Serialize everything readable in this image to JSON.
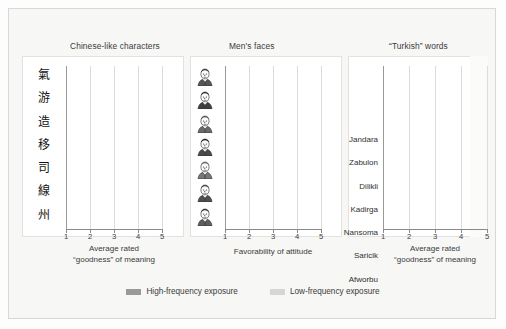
{
  "figure": {
    "background_color": "#f7f7f6",
    "high_color": "#9a9a9a",
    "low_color": "#d6d6d6"
  },
  "legend": {
    "items": [
      {
        "label": "High-frequency exposure",
        "color": "#9a9a9a",
        "key": "high"
      },
      {
        "label": "Low-frequency exposure",
        "color": "#d6d6d6",
        "key": "low"
      }
    ]
  },
  "chart_data": [
    {
      "type": "bar",
      "title": "Chinese-like characters",
      "orientation": "horizontal",
      "xlabel_line1": "Average rated",
      "xlabel_line2": "“goodness” of meaning",
      "ylabel": "",
      "xlim": [
        1,
        5
      ],
      "xticks": [
        1,
        2,
        3,
        4,
        5
      ],
      "grid": true,
      "legend_position": "bottom",
      "categories": [
        "char-1",
        "char-2",
        "char-3",
        "char-4",
        "char-5",
        "char-6",
        "char-7"
      ],
      "category_glyphs": [
        "氣",
        "游",
        "造",
        "移",
        "司",
        "線",
        "州"
      ],
      "series": [
        {
          "name": "High-frequency exposure",
          "key": "high",
          "values": [
            4.0,
            3.5,
            3.3,
            3.4,
            3.3,
            2.9,
            2.9
          ]
        },
        {
          "name": "Low-frequency exposure",
          "key": "low",
          "values": [
            3.4,
            3.0,
            1.4,
            2.9,
            2.5,
            2.4,
            2.6
          ]
        }
      ]
    },
    {
      "type": "bar",
      "title": "Men's faces",
      "orientation": "horizontal",
      "xlabel_line1": "Favorability of attitude",
      "xlabel_line2": "",
      "ylabel": "",
      "xlim": [
        1,
        5
      ],
      "xticks": [
        1,
        2,
        3,
        4,
        5
      ],
      "grid": true,
      "legend_position": "bottom",
      "categories": [
        "face-1",
        "face-2",
        "face-3",
        "face-4",
        "face-5",
        "face-6",
        "face-7"
      ],
      "series": [
        {
          "name": "High-frequency exposure",
          "key": "high",
          "values": [
            2.7,
            3.6,
            3.5,
            3.8,
            3.6,
            3.5,
            1.8
          ]
        },
        {
          "name": "Low-frequency exposure",
          "key": "low",
          "values": [
            2.7,
            2.5,
            2.7,
            2.7,
            2.5,
            2.3,
            1.8
          ]
        }
      ]
    },
    {
      "type": "bar",
      "title": "“Turkish” words",
      "orientation": "horizontal",
      "xlabel_line1": "Average rated",
      "xlabel_line2": "“goodness” of meaning",
      "ylabel": "",
      "xlim": [
        1,
        5
      ],
      "xticks": [
        1,
        2,
        3,
        4,
        5
      ],
      "grid": true,
      "legend_position": "bottom",
      "categories": [
        "Jandara",
        "Zabulon",
        "Dilikli",
        "Kadirga",
        "Nansoma",
        "Saricik",
        "Afworbu"
      ],
      "series": [
        {
          "name": "High-frequency exposure",
          "key": "high",
          "values": [
            4.2,
            3.4,
            3.3,
            3.2,
            3.15,
            3.0,
            2.45
          ]
        },
        {
          "name": "Low-frequency exposure",
          "key": "low",
          "values": [
            3.85,
            2.9,
            2.8,
            2.5,
            2.7,
            2.1,
            2.05
          ]
        }
      ]
    }
  ]
}
